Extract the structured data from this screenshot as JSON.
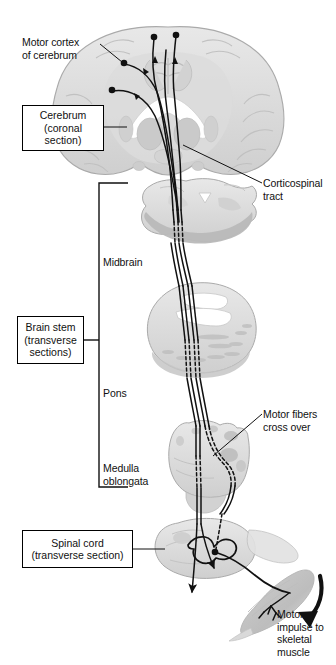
{
  "figure": {
    "background_color": "#ffffff",
    "ink_color": "#111111",
    "tissue_fill": "#d9d9d9",
    "tissue_fill_light": "#e6e6e6",
    "tissue_fill_dark": "#bdbdbd",
    "tissue_stroke": "#a8a8a8"
  },
  "labels": {
    "motor_cortex": "Motor cortex\nof cerebrum",
    "corticospinal_tract": "Corticospinal\ntract",
    "midbrain": "Midbrain",
    "pons": "Pons",
    "medulla_oblongata": "Medulla\noblongata",
    "motor_fibers_cross_over": "Motor fibers\ncross over",
    "motor_impulse": "Motor\nimpulse to\nskeletal\nmuscle"
  },
  "boxed_labels": {
    "cerebrum": "Cerebrum\n(coronal\nsection)",
    "brain_stem": "Brain stem\n(transverse\nsections)",
    "spinal_cord": "Spinal cord\n(transverse section)"
  },
  "structures": [
    {
      "name": "cerebrum-coronal-section",
      "label": "Cerebrum (coronal section)"
    },
    {
      "name": "midbrain-transverse-section",
      "label": "Midbrain"
    },
    {
      "name": "pons-transverse-section",
      "label": "Pons"
    },
    {
      "name": "medulla-oblongata-transverse-section",
      "label": "Medulla oblongata"
    },
    {
      "name": "spinal-cord-transverse-section",
      "label": "Spinal cord (transverse section)"
    },
    {
      "name": "skeletal-muscle",
      "label": "Skeletal muscle"
    }
  ]
}
